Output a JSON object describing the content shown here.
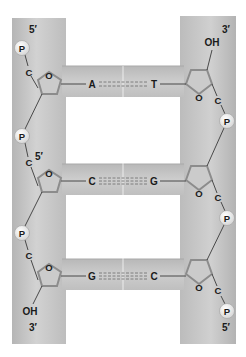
{
  "diagram": {
    "colors": {
      "background": "#ffffff",
      "strand_band": "#bdbdbd",
      "strand_band_light": "#d6d6d6",
      "rung_band": "#c4c4c4",
      "ring_stroke": "#8a8a8a",
      "ring_fill": "#cfcfcf",
      "bond_line": "#3a3a3a",
      "phosphate_fill": "#ececec",
      "phosphate_stroke": "#9a9a9a",
      "text": "#1a1a1a"
    },
    "left_strand": {
      "top_label": "5′",
      "bottom_label": "3′",
      "bottom_group": "OH",
      "phosphates": [
        "P",
        "P",
        "P"
      ],
      "carbons": [
        "C",
        "C",
        "C"
      ],
      "inner_prime_label": "5′",
      "ring_oxygen": [
        "O",
        "O",
        "O"
      ]
    },
    "right_strand": {
      "top_label": "3′",
      "top_group": "OH",
      "bottom_label": "5′",
      "phosphates": [
        "P",
        "P",
        "P"
      ],
      "carbons": [
        "C",
        "C",
        "C"
      ],
      "ring_oxygen": [
        "O",
        "O",
        "O"
      ]
    },
    "base_pairs": [
      {
        "left": "A",
        "right": "T",
        "bond": "double hydrogen bond"
      },
      {
        "left": "C",
        "right": "G",
        "bond": "triple hydrogen bond"
      },
      {
        "left": "G",
        "right": "C",
        "bond": "triple hydrogen bond"
      }
    ]
  }
}
